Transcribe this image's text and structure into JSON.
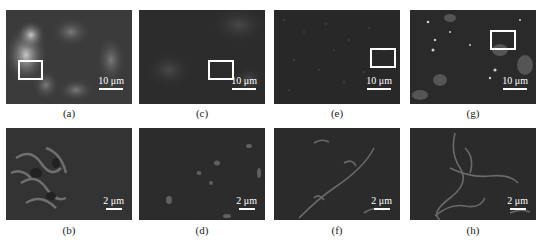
{
  "figure": {
    "type": "SEM micrograph grid",
    "rows": 2,
    "cols": 4,
    "top_row": [
      {
        "label": "(a)",
        "scale": "10 μm",
        "texture": "bright-patchy",
        "zoom_box": {
          "x": 12,
          "y": 50,
          "w": 25,
          "h": 20
        }
      },
      {
        "label": "(c)",
        "scale": "10 μm",
        "texture": "dark-fine",
        "zoom_box": {
          "x": 69,
          "y": 50,
          "w": 26,
          "h": 20
        }
      },
      {
        "label": "(e)",
        "scale": "10 μm",
        "texture": "dark-uniform",
        "zoom_box": {
          "x": 96,
          "y": 38,
          "w": 26,
          "h": 20
        }
      },
      {
        "label": "(g)",
        "scale": "10 μm",
        "texture": "particles",
        "zoom_box": {
          "x": 80,
          "y": 20,
          "w": 26,
          "h": 20
        }
      }
    ],
    "bottom_row": [
      {
        "label": "(b)",
        "scale": "2 μm",
        "texture": "rough-ridges"
      },
      {
        "label": "(d)",
        "scale": "2 μm",
        "texture": "smooth-dots"
      },
      {
        "label": "(f)",
        "scale": "2 μm",
        "texture": "diagonal-ridge"
      },
      {
        "label": "(h)",
        "scale": "2 μm",
        "texture": "network-ridges"
      }
    ]
  },
  "colors": {
    "panel_bg": "#2a2a2a",
    "highlight": "#ffffff",
    "label_text": "#222222"
  }
}
